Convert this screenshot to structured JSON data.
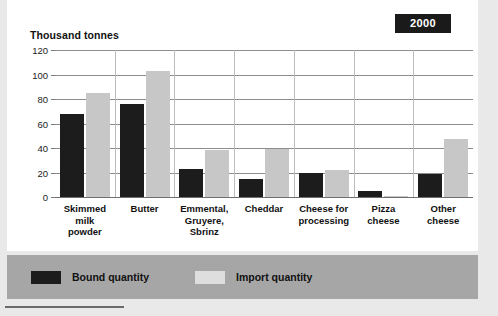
{
  "badge": {
    "label": "2000"
  },
  "legend": {
    "items": [
      {
        "label": "Bound quantity",
        "color": "#1c1c1c"
      },
      {
        "label": "Import quantity",
        "color": "#dedede"
      }
    ]
  },
  "chart_data": {
    "type": "bar",
    "title": "",
    "subtitle": "",
    "xlabel": "",
    "ylabel": "Thousand tonnes",
    "ylim": [
      0,
      120
    ],
    "yticks": [
      0,
      20,
      40,
      60,
      80,
      100,
      120
    ],
    "grid": true,
    "legend_position": "bottom",
    "annotations": [
      "2000"
    ],
    "categories": [
      "Skimmed milk powder",
      "Butter",
      "Emmental, Gruyere, Sbrinz",
      "Cheddar",
      "Cheese for processing",
      "Pizza cheese",
      "Other cheese"
    ],
    "category_lines": [
      [
        "Skimmed",
        "milk",
        "powder"
      ],
      [
        "Butter"
      ],
      [
        "Emmental,",
        "Gruyere,",
        "Sbrinz"
      ],
      [
        "Cheddar"
      ],
      [
        "Cheese for",
        "processing"
      ],
      [
        "Pizza",
        "cheese"
      ],
      [
        "Other",
        "cheese"
      ]
    ],
    "series": [
      {
        "name": "Bound quantity",
        "color": "#1c1c1c",
        "values": [
          68,
          76,
          23,
          15,
          20,
          5,
          19
        ]
      },
      {
        "name": "Import quantity",
        "color": "#c7c7c7",
        "values": [
          85,
          103,
          38,
          39,
          22,
          0.5,
          47
        ]
      }
    ]
  }
}
